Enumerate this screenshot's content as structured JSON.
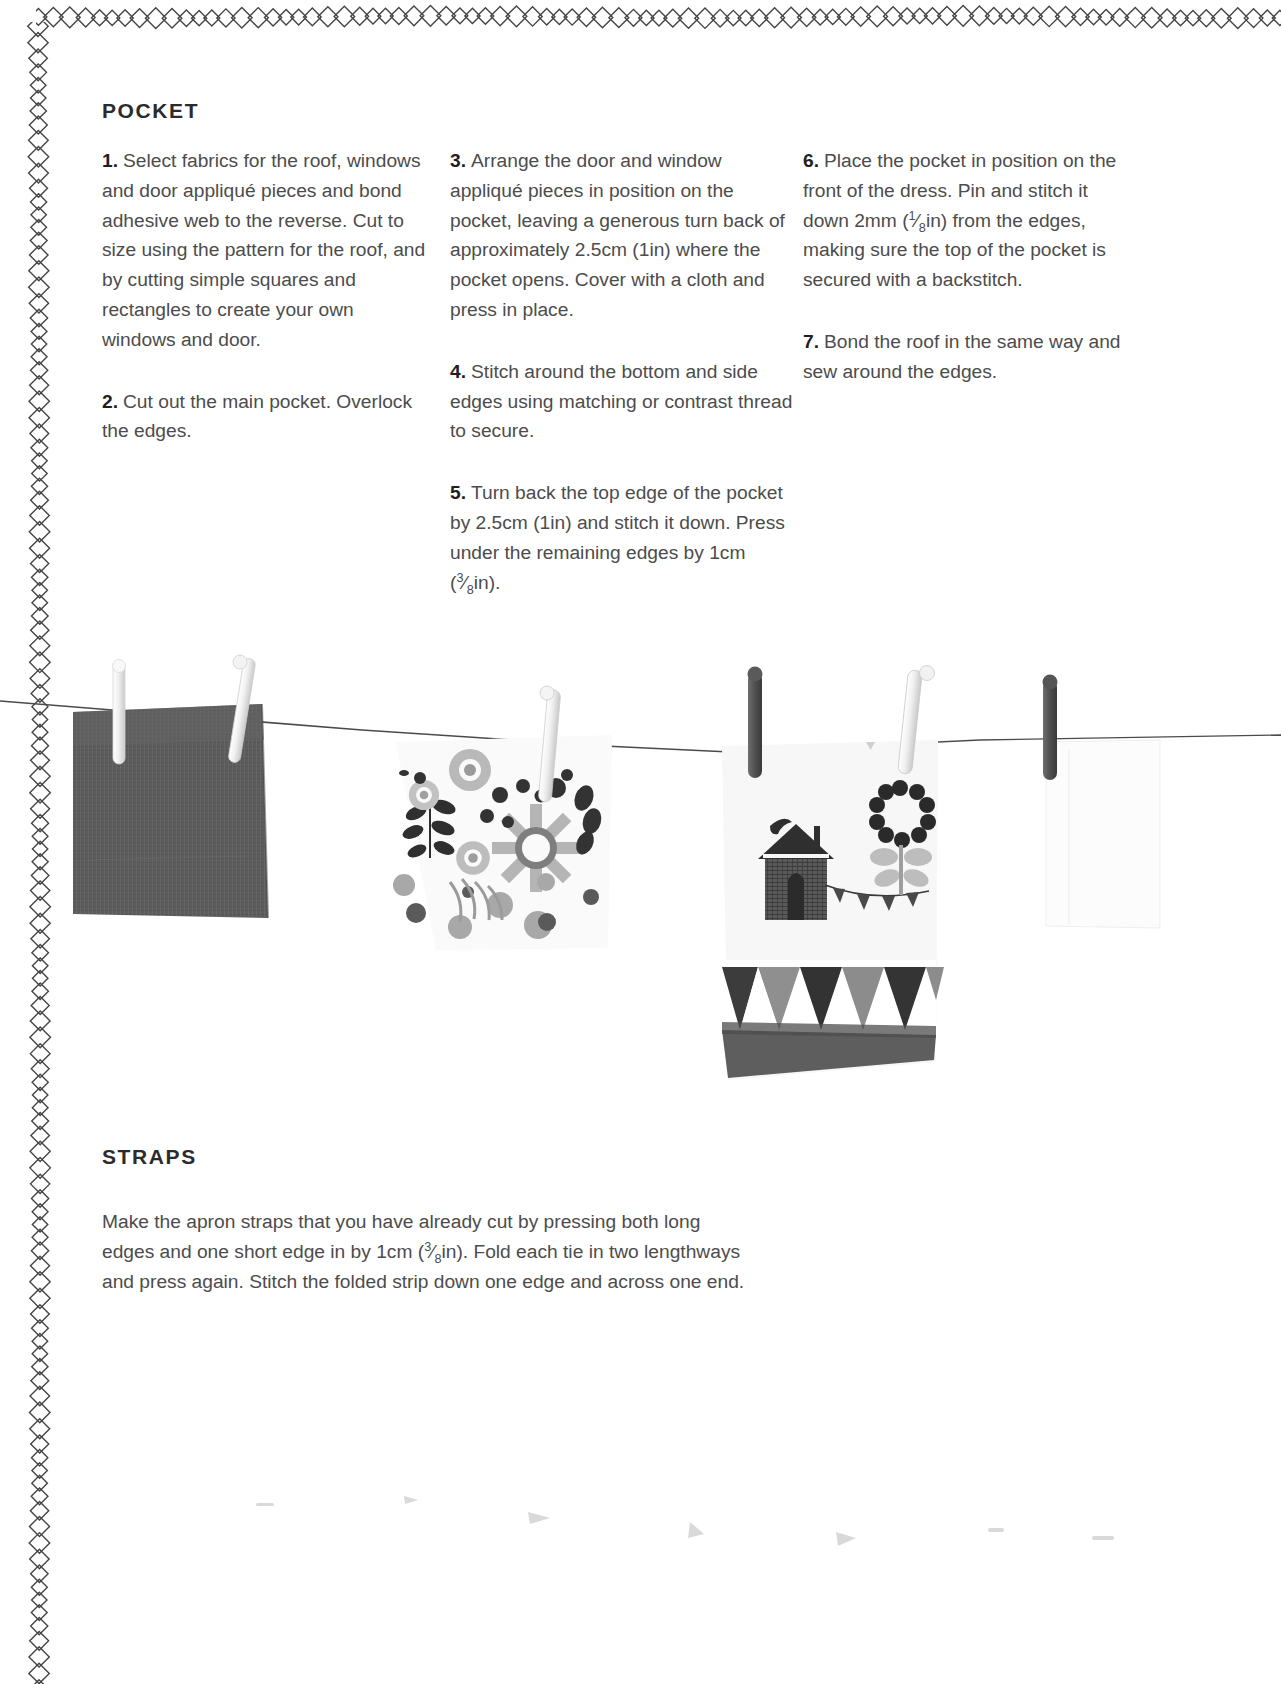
{
  "page": {
    "background_color": "#ffffff",
    "text_color": "#4c4c4c",
    "heading_color": "#2b2b2b",
    "border_style": "diamond-chain"
  },
  "pocket": {
    "heading": "POCKET",
    "steps": [
      {
        "number": "1.",
        "text": "Select fabrics for the roof, windows and door appliqué pieces and bond adhesive web to the reverse.  Cut to size using the pattern for the roof, and by cutting simple squares and rectangles to create your own windows and door."
      },
      {
        "number": "2.",
        "text": "Cut out the main pocket. Overlock the edges."
      },
      {
        "number": "3.",
        "text": "Arrange the door and window appliqué pieces in position on the pocket, leaving a generous turn back of approximately 2.5cm (1in) where the pocket opens. Cover with a cloth and press in place."
      },
      {
        "number": "4.",
        "text": "Stitch around the bottom and side edges using matching or contrast thread to secure."
      },
      {
        "number": "5.",
        "text_before": "Turn back the top edge of the pocket by 2.5cm (1in) and stitch it down. Press under the remaining edges by 1cm (",
        "fraction_numerator": "3",
        "fraction_denominator": "8",
        "text_after": "in)."
      },
      {
        "number": "6.",
        "text_before": "Place the pocket in position on the front of the dress. Pin and stitch it down 2mm (",
        "fraction_numerator": "1",
        "fraction_denominator": "8",
        "text_after": "in) from the edges, making sure the top of the pocket is secured with a backstitch."
      },
      {
        "number": "7.",
        "text": "Bond the roof in the same way and sew around the edges."
      }
    ]
  },
  "straps": {
    "heading": "STRAPS",
    "text_before": "Make the apron straps that you have already cut by pressing both long edges and one short edge in by 1cm (",
    "fraction_numerator": "3",
    "fraction_denominator": "8",
    "text_after": "in). Fold each tie in two lengthways and press again. Stitch the folded strip down one edge and across one end."
  },
  "photo": {
    "description": "Black and white photograph of fabric swatches pegged on a washing line",
    "items": [
      {
        "name": "denim-fabric-swatch",
        "color": "#595959"
      },
      {
        "name": "floral-print-fabric-swatch",
        "color": "#f4f4f4"
      },
      {
        "name": "house-print-fabric-swatch",
        "color": "#f2f2f2"
      },
      {
        "name": "plain-white-fabric-swatch",
        "color": "#fbfbfb"
      }
    ],
    "clothespins": 7,
    "line_color": "#3a3a3a"
  }
}
